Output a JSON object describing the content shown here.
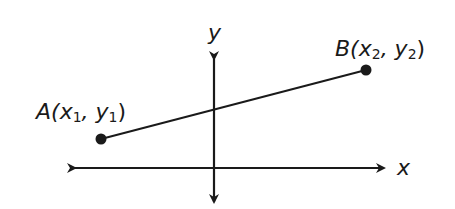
{
  "diagram": {
    "axes": {
      "x_label": "x",
      "y_label": "y"
    },
    "points": [
      {
        "name": "A",
        "label_main": "A(x",
        "sub1": "1",
        "mid": ", y",
        "sub2": "1",
        "close": ")"
      },
      {
        "name": "B",
        "label_main": "B(x",
        "sub1": "2",
        "mid": ", y",
        "sub2": "2",
        "close": ")"
      }
    ],
    "colors": {
      "stroke": "#1a1a1a",
      "background": "#ffffff"
    }
  }
}
